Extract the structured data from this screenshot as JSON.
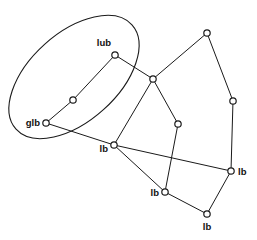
{
  "figure": {
    "background_color": "#ffffff",
    "stroke_color": "#1a1a1a",
    "node_fill_color": "#ffffff",
    "label_color": "#111111",
    "width": 257,
    "height": 240
  },
  "region": {
    "name": "bounding-ellipse",
    "cx": 74,
    "cy": 77,
    "rx": 78,
    "ry": 44,
    "rotation_deg": -42
  },
  "nodes": [
    {
      "id": "n_lub",
      "label": "lub",
      "x": 115,
      "y": 55,
      "label_dx": -4,
      "label_dy": -9,
      "label_anchor": "end"
    },
    {
      "id": "n_mid_l",
      "label": "",
      "x": 73,
      "y": 100,
      "label_dx": 0,
      "label_dy": 0,
      "label_anchor": "middle"
    },
    {
      "id": "n_glb",
      "label": "glb",
      "x": 46,
      "y": 123,
      "label_dx": -6,
      "label_dy": 3,
      "label_anchor": "end"
    },
    {
      "id": "n_center",
      "label": "",
      "x": 153,
      "y": 79,
      "label_dx": 0,
      "label_dy": 0,
      "label_anchor": "middle"
    },
    {
      "id": "n_lb_l",
      "label": "lb",
      "x": 114,
      "y": 145,
      "label_dx": -6,
      "label_dy": 7,
      "label_anchor": "end"
    },
    {
      "id": "n_top",
      "label": "",
      "x": 207,
      "y": 33,
      "label_dx": 0,
      "label_dy": 0,
      "label_anchor": "middle"
    },
    {
      "id": "n_right",
      "label": "",
      "x": 233,
      "y": 101,
      "label_dx": 0,
      "label_dy": 0,
      "label_anchor": "middle"
    },
    {
      "id": "n_mid_r",
      "label": "",
      "x": 178,
      "y": 124,
      "label_dx": 0,
      "label_dy": 0,
      "label_anchor": "middle"
    },
    {
      "id": "n_lb_r",
      "label": "lb",
      "x": 231,
      "y": 171,
      "label_dx": 7,
      "label_dy": 4,
      "label_anchor": "start"
    },
    {
      "id": "n_lb_m",
      "label": "lb",
      "x": 165,
      "y": 192,
      "label_dx": -6,
      "label_dy": 4,
      "label_anchor": "end"
    },
    {
      "id": "n_lb_b",
      "label": "lb",
      "x": 207,
      "y": 214,
      "label_dx": 0,
      "label_dy": 16,
      "label_anchor": "middle"
    }
  ],
  "edges": [
    {
      "id": "e_lub_midl",
      "from": "n_lub",
      "to": "n_mid_l"
    },
    {
      "id": "e_midl_glb",
      "from": "n_mid_l",
      "to": "n_glb"
    },
    {
      "id": "e_lub_center",
      "from": "n_lub",
      "to": "n_center"
    },
    {
      "id": "e_glb_lbl",
      "from": "n_glb",
      "to": "n_lb_l"
    },
    {
      "id": "e_center_lbl",
      "from": "n_center",
      "to": "n_lb_l"
    },
    {
      "id": "e_center_top",
      "from": "n_center",
      "to": "n_top"
    },
    {
      "id": "e_center_midr",
      "from": "n_center",
      "to": "n_mid_r"
    },
    {
      "id": "e_top_right",
      "from": "n_top",
      "to": "n_right"
    },
    {
      "id": "e_right_lbr",
      "from": "n_right",
      "to": "n_lb_r"
    },
    {
      "id": "e_midr_lbm",
      "from": "n_mid_r",
      "to": "n_lb_m"
    },
    {
      "id": "e_lbl_lbr",
      "from": "n_lb_l",
      "to": "n_lb_r"
    },
    {
      "id": "e_lbl_lbm",
      "from": "n_lb_l",
      "to": "n_lb_m"
    },
    {
      "id": "e_lbm_lbb",
      "from": "n_lb_m",
      "to": "n_lb_b"
    },
    {
      "id": "e_lbb_lbr",
      "from": "n_lb_b",
      "to": "n_lb_r"
    }
  ],
  "node_radius": 3.2
}
